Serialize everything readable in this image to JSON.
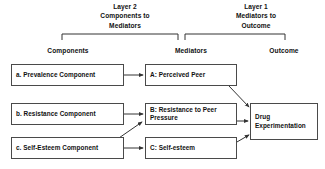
{
  "diagram": {
    "layer_titles": [
      {
        "id": "layer-2",
        "line1": "Layer 2",
        "line2": "Components to",
        "line3": "Mediators"
      },
      {
        "id": "layer-1",
        "line1": "Layer 1",
        "line2": "Mediators to",
        "line3": "Outcome"
      }
    ],
    "column_headers": {
      "components": "Components",
      "mediators": "Mediators",
      "outcome": "Outcome"
    },
    "components": [
      {
        "id": "a",
        "label": "a. Prevalence Component"
      },
      {
        "id": "b",
        "label": "b. Resistance Component"
      },
      {
        "id": "c",
        "label": "c. Self-Esteem Component"
      }
    ],
    "mediators": [
      {
        "id": "A",
        "label": "A: Perceived Peer"
      },
      {
        "id": "B",
        "label": "B: Resistance to Peer Pressure"
      },
      {
        "id": "C",
        "label": "C: Self-esteem"
      }
    ],
    "outcome": {
      "id": "outcome",
      "label": "Drug Experimentation"
    },
    "colors": {
      "box_border": "#4a4a4a",
      "arrow": "#333333",
      "text": "#111111",
      "background": "#ffffff"
    },
    "edges": [
      {
        "from": "a. Prevalence Component",
        "to": "A: Perceived Peer"
      },
      {
        "from": "b. Resistance Component",
        "to": "B: Resistance to Peer Pressure"
      },
      {
        "from": "c. Self-Esteem Component",
        "to": "C: Self-esteem"
      },
      {
        "from": "c. Self-Esteem Component",
        "to": "B: Resistance to Peer Pressure"
      },
      {
        "from": "A: Perceived Peer",
        "to": "Drug Experimentation"
      },
      {
        "from": "B: Resistance to Peer Pressure",
        "to": "Drug Experimentation"
      },
      {
        "from": "C: Self-esteem",
        "to": "Drug Experimentation"
      }
    ]
  }
}
